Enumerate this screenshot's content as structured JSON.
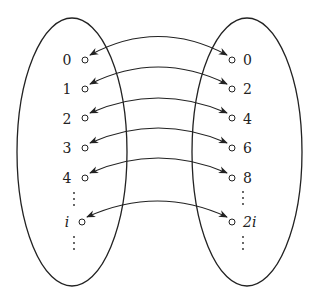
{
  "diagram": {
    "left_set": {
      "labels": [
        "0",
        "1",
        "2",
        "3",
        "4",
        "i"
      ],
      "continuation_dots": true
    },
    "right_set": {
      "labels": [
        "0",
        "2",
        "4",
        "6",
        "8",
        "2i"
      ],
      "continuation_dots": true
    },
    "mapping": [
      {
        "from": "0",
        "to": "0"
      },
      {
        "from": "1",
        "to": "2"
      },
      {
        "from": "2",
        "to": "4"
      },
      {
        "from": "3",
        "to": "6"
      },
      {
        "from": "4",
        "to": "8"
      },
      {
        "from": "i",
        "to": "2i"
      }
    ],
    "arrow_style": "double-headed curved",
    "colors": {
      "stroke": "#222222",
      "background": "#ffffff"
    }
  }
}
